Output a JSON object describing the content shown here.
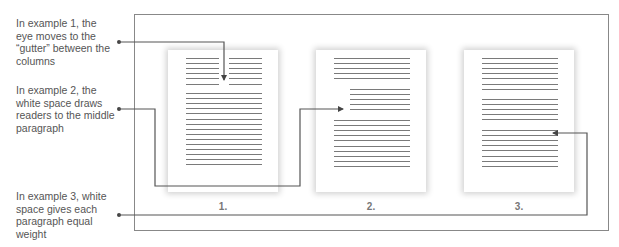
{
  "captions": [
    {
      "id": 1,
      "text": "In example 1, the eye moves to the “gutter” between the columns"
    },
    {
      "id": 2,
      "text": "In example 2, the white space draws readers to the middle paragraph"
    },
    {
      "id": 3,
      "text": "In example 3, white space gives each paragraph equal weight"
    }
  ],
  "pages": [
    {
      "label": "1.",
      "layout": "two-column top (6 lines each) + 15 full-width lines"
    },
    {
      "label": "2.",
      "layout": "5 lines, indented middle paragraph (5 lines), 10 lines"
    },
    {
      "label": "3.",
      "layout": "three paragraphs: 7 lines, 5 lines, 8 lines"
    }
  ],
  "colors": {
    "text": "#555555",
    "rule": "#7a7a7a",
    "connector": "#555555",
    "frame": "#888888"
  }
}
